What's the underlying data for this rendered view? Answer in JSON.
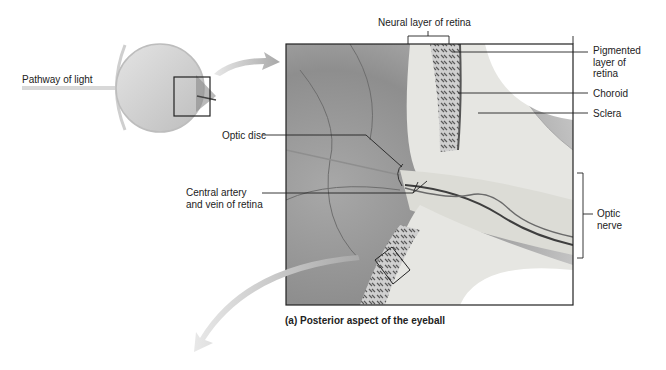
{
  "diagram": {
    "caption": "(a) Posterior aspect of the eyeball",
    "labels": {
      "pathway_of_light": "Pathway of light",
      "neural_layer": "Neural layer of retina",
      "pigmented_layer": [
        "Pigmented",
        "layer of",
        "retina"
      ],
      "choroid": "Choroid",
      "sclera": "Sclera",
      "optic_disc": "Optic disc",
      "central_artery": [
        "Central artery",
        "and vein of retina"
      ],
      "optic_nerve": [
        "Optic",
        "nerve"
      ]
    },
    "colors": {
      "background": "#ffffff",
      "frame": "#222222",
      "vitreous_dark": "#7a7a7a",
      "tissue_light": "#e6e6e2",
      "arrow": "#b8b8b8"
    }
  }
}
